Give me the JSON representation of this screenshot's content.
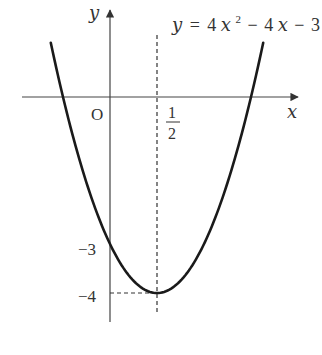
{
  "diagram": {
    "equation": {
      "lhs": "y",
      "eq": "=",
      "coef_a": "4",
      "var": "x",
      "exp": "2",
      "op1": "−",
      "term_b": "4",
      "var2": "x",
      "op2": "−",
      "const": "3"
    },
    "axes": {
      "x_label": "x",
      "y_label": "y",
      "origin_label": "O"
    },
    "labels": {
      "vertex_x_num": "1",
      "vertex_x_den": "2",
      "y_intercept": "−3",
      "vertex_y": "−4"
    },
    "function": {
      "a": 4,
      "b": -4,
      "c": -3,
      "vertex": [
        0.5,
        -4
      ],
      "roots": [
        -0.5,
        1.5
      ],
      "y_intercept": -3
    },
    "colors": {
      "curve": "#1a1a1a",
      "axis": "#444444",
      "dashed": "#333333"
    }
  }
}
